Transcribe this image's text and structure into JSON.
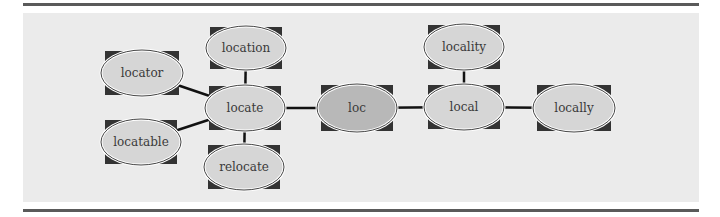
{
  "diagram": {
    "colors": {
      "background": "#ebebeb",
      "rule": "#5a5a5a",
      "node_fill": "#d6d6d6",
      "root_fill": "#b8b8b8",
      "corner_fill": "#333333",
      "edge": "#111111"
    },
    "nodes": [
      {
        "id": "locator",
        "label": "locator",
        "cx": 142,
        "cy": 73,
        "rx": 41,
        "ry": 23,
        "root": false
      },
      {
        "id": "location",
        "label": "location",
        "cx": 246,
        "cy": 48,
        "rx": 40,
        "ry": 22,
        "root": false
      },
      {
        "id": "locate",
        "label": "locate",
        "cx": 245,
        "cy": 108,
        "rx": 40,
        "ry": 23,
        "root": false
      },
      {
        "id": "locatable",
        "label": "locatable",
        "cx": 141,
        "cy": 142,
        "rx": 40,
        "ry": 23,
        "root": false
      },
      {
        "id": "relocate",
        "label": "relocate",
        "cx": 244,
        "cy": 167,
        "rx": 40,
        "ry": 23,
        "root": false
      },
      {
        "id": "loc",
        "label": "loc",
        "cx": 357,
        "cy": 108,
        "rx": 40,
        "ry": 24,
        "root": true
      },
      {
        "id": "local",
        "label": "local",
        "cx": 464,
        "cy": 107,
        "rx": 40,
        "ry": 23,
        "root": false
      },
      {
        "id": "locality",
        "label": "locality",
        "cx": 464,
        "cy": 47,
        "rx": 40,
        "ry": 23,
        "root": false
      },
      {
        "id": "locally",
        "label": "locally",
        "cx": 574,
        "cy": 108,
        "rx": 41,
        "ry": 24,
        "root": false
      }
    ],
    "edges": [
      {
        "from": "locator",
        "to": "locate"
      },
      {
        "from": "location",
        "to": "locate"
      },
      {
        "from": "locatable",
        "to": "locate"
      },
      {
        "from": "relocate",
        "to": "locate"
      },
      {
        "from": "locate",
        "to": "loc"
      },
      {
        "from": "loc",
        "to": "local"
      },
      {
        "from": "locality",
        "to": "local"
      },
      {
        "from": "local",
        "to": "locally"
      }
    ]
  }
}
